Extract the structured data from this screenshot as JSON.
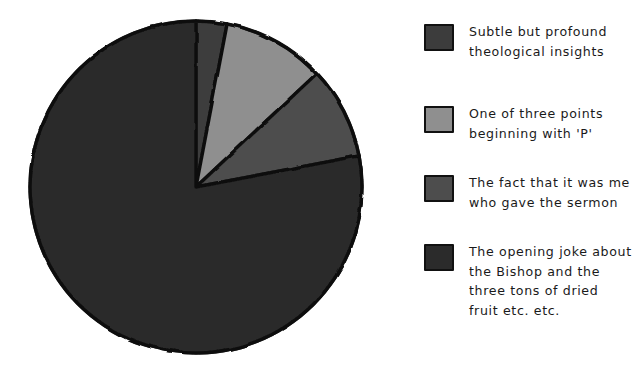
{
  "chart_data": {
    "type": "pie",
    "title": "",
    "labels": [
      "Subtle but profound\ntheological insights",
      "One of three points\nbeginning with 'P'",
      "The fact that it was me\nwho gave the sermon",
      "The opening joke about\nthe Bishop and the\nthree tons of dried\nfruit etc. etc."
    ],
    "values": [
      3,
      10,
      9,
      78
    ],
    "colors": [
      "#3c3c3c",
      "#8f8f8f",
      "#4d4d4d",
      "#2b2b2b"
    ],
    "edge_color": "#111111",
    "start_angle_deg": 90,
    "direction": "clockwise",
    "legend_position": "right",
    "grid": false,
    "style": "hand-drawn",
    "units": "percent"
  },
  "legend": {
    "items": [
      {
        "label": "Subtle but profound\ntheological insights",
        "color": "#3c3c3c",
        "swatch_name": "legend-swatch-theological-insights"
      },
      {
        "label": "One of three points\nbeginning with 'P'",
        "color": "#8f8f8f",
        "swatch_name": "legend-swatch-three-points-p"
      },
      {
        "label": "The fact that it was me\nwho gave the sermon",
        "color": "#4d4d4d",
        "swatch_name": "legend-swatch-gave-the-sermon"
      },
      {
        "label": "The opening joke about\nthe Bishop and the\nthree tons of dried\nfruit etc. etc.",
        "color": "#2b2b2b",
        "swatch_name": "legend-swatch-opening-joke"
      }
    ]
  },
  "pie": {
    "center_x": 196,
    "center_y": 187,
    "radius": 166
  }
}
